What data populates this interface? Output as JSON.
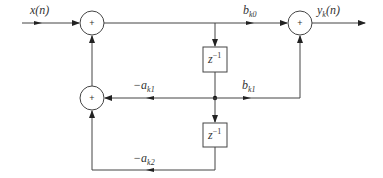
{
  "diagram": {
    "input_label": "x(n)",
    "output_label": {
      "base": "y",
      "sub": "k",
      "tail": "(n)"
    },
    "adder_symbol": "+",
    "delay_label": {
      "base": "z",
      "sup": "−1"
    },
    "coefficients": {
      "b_k0": {
        "base": "b",
        "sub": "k0"
      },
      "b_k1": {
        "base": "b",
        "sub": "k1"
      },
      "a_k1": {
        "base": "−a",
        "sub": "k1"
      },
      "a_k2": {
        "base": "−a",
        "sub": "k2"
      }
    },
    "nodes": [
      "input-adder",
      "feedback-adder",
      "output-adder",
      "delay-1",
      "delay-2",
      "junction"
    ]
  }
}
